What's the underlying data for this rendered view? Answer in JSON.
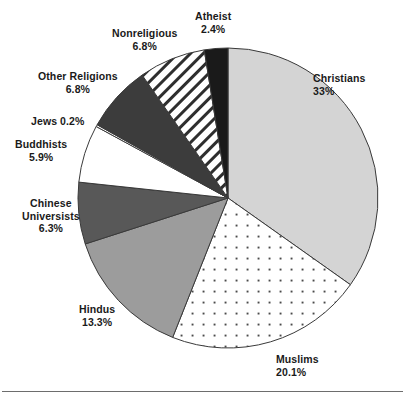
{
  "chart_data": {
    "type": "pie",
    "title": "",
    "subtitle": "",
    "xlabel": "",
    "ylabel": "",
    "legend_position": "none",
    "grid": false,
    "start_angle_deg": 0,
    "direction": "clockwise",
    "units": "percent",
    "categories": [
      "Christians",
      "Muslims",
      "Hindus",
      "Chinese Universists",
      "Buddhists",
      "Jews",
      "Other Religions",
      "Nonreligious",
      "Atheist"
    ],
    "values": [
      33,
      20.1,
      13.3,
      6.3,
      5.9,
      0.2,
      6.8,
      6.8,
      2.4
    ],
    "value_labels": [
      "33%",
      "20.1%",
      "13.3%",
      "6.3%",
      "5.9%",
      "0.2%",
      "6.8%",
      "6.8%",
      "2.4%"
    ],
    "slices": [
      {
        "name": "Christians",
        "value": 33,
        "value_label": "33%",
        "label_lines": [
          "Christians",
          "33%"
        ],
        "fill": "#d4d4d4",
        "pattern": "solid",
        "label_x": 313,
        "label_y": 72,
        "label_align": "lbl-right"
      },
      {
        "name": "Muslims",
        "value": 20.1,
        "value_label": "20.1%",
        "label_lines": [
          "Muslims",
          "20.1%"
        ],
        "fill": "#ffffff",
        "pattern": "dots",
        "label_x": 276,
        "label_y": 353,
        "label_align": "lbl-right"
      },
      {
        "name": "Hindus",
        "value": 13.3,
        "value_label": "13.3%",
        "label_lines": [
          "Hindus",
          "13.3%"
        ],
        "fill": "#9c9c9c",
        "pattern": "solid",
        "label_x": 79,
        "label_y": 303,
        "label_align": "lbl-center"
      },
      {
        "name": "Chinese Universists",
        "value": 6.3,
        "value_label": "6.3%",
        "label_lines": [
          "Chinese",
          "Universists",
          "6.3%"
        ],
        "fill": "#585858",
        "pattern": "solid",
        "label_x": 22,
        "label_y": 197,
        "label_align": "lbl-center"
      },
      {
        "name": "Buddhists",
        "value": 5.9,
        "value_label": "5.9%",
        "label_lines": [
          "Buddhists",
          "5.9%"
        ],
        "fill": "#ffffff",
        "pattern": "solid",
        "label_x": 15,
        "label_y": 138,
        "label_align": "lbl-center"
      },
      {
        "name": "Jews",
        "value": 0.2,
        "value_label": "0.2%",
        "label_lines": [
          "Jews 0.2%"
        ],
        "fill": "#ffffff",
        "pattern": "solid",
        "label_x": 31,
        "label_y": 115,
        "label_align": "lbl-center"
      },
      {
        "name": "Other Religions",
        "value": 6.8,
        "value_label": "6.8%",
        "label_lines": [
          "Other Religions",
          "6.8%"
        ],
        "fill": "#3c3c3c",
        "pattern": "solid",
        "label_x": 38,
        "label_y": 70,
        "label_align": "lbl-center"
      },
      {
        "name": "Nonreligious",
        "value": 6.8,
        "value_label": "6.8%",
        "label_lines": [
          "Nonreligious",
          "6.8%"
        ],
        "fill": "#ffffff",
        "pattern": "diagonal-hatch",
        "label_x": 112,
        "label_y": 27,
        "label_align": "lbl-center"
      },
      {
        "name": "Atheist",
        "value": 2.4,
        "value_label": "2.4%",
        "label_lines": [
          "Atheist",
          "2.4%"
        ],
        "fill": "#1a1a1a",
        "pattern": "solid",
        "label_x": 195,
        "label_y": 10,
        "label_align": "lbl-center"
      }
    ],
    "geometry": {
      "center_x": 228,
      "center_y": 198,
      "radius": 150,
      "outline_color": "#3a3a3a",
      "outline_width": 1
    }
  },
  "figure": {
    "has_footer_rule": true
  }
}
